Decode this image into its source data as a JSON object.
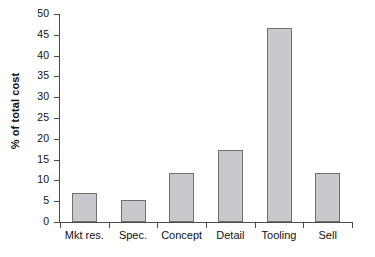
{
  "chart_data": {
    "type": "bar",
    "title": "",
    "subtitle": "",
    "xlabel": "",
    "ylabel": "% of total cost",
    "categories": [
      "Mkt res.",
      "Spec.",
      "Concept",
      "Detail",
      "Tooling",
      "Sell"
    ],
    "values": [
      7.0,
      5.3,
      11.8,
      17.4,
      46.7,
      11.8
    ],
    "ylim": [
      0,
      50
    ],
    "ytick_step": 5,
    "ytick_labels": [
      "0",
      "5",
      "10",
      "15",
      "20",
      "25",
      "30",
      "35",
      "40",
      "45",
      "50"
    ],
    "grid": false,
    "legend": false,
    "legend_position": "none",
    "annotations": [],
    "colors": {
      "bar_fill": "#c9c9cd",
      "bar_border": "#6f6f74",
      "axis": "#4a4a4a",
      "text": "#111111",
      "background": "#ffffff"
    }
  }
}
